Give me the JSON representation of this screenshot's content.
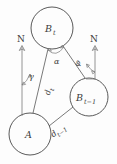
{
  "figure": {
    "type": "geometry-diagram",
    "background_color": "#fdfdfd",
    "stroke_color": "#5a5a5a",
    "text_color": "#3a3a3a"
  },
  "nodes": [
    {
      "id": "b-t",
      "label": "B",
      "subscript": "t",
      "cx": 52,
      "cy": 28,
      "r": 21
    },
    {
      "id": "b-t-minus-1",
      "label": "B",
      "subscript": "t−1",
      "cx": 89,
      "cy": 97,
      "r": 19
    },
    {
      "id": "a",
      "label": "A",
      "subscript": "",
      "cx": 30,
      "cy": 134,
      "r": 21
    }
  ],
  "north_arrows": [
    {
      "id": "north-left",
      "label": "N",
      "label_x": 20,
      "label_y": 41,
      "x": 22,
      "y_top": 46,
      "y_bottom": 116
    },
    {
      "id": "north-right",
      "label": "N",
      "label_x": 93,
      "label_y": 41,
      "x": 95,
      "y_top": 46,
      "y_bottom": 78
    }
  ],
  "angles": [
    {
      "id": "alpha",
      "label": "α",
      "x": 58,
      "y": 62,
      "description": "angle at B_t between line to A and line to B_{t-1}"
    },
    {
      "id": "gamma",
      "label": "γ",
      "x": 32,
      "y": 78,
      "description": "bearing angle at A from North to B_t"
    },
    {
      "id": "phi",
      "label": "φ",
      "x": 80,
      "y": 64,
      "description": "bearing angle at B_{t-1} from North"
    }
  ],
  "distances": [
    {
      "id": "d-t",
      "label": "d",
      "subscript": "t",
      "x": 46,
      "y": 92,
      "rotation": -68,
      "description": "distance from A to B_t"
    },
    {
      "id": "d-t-minus-1",
      "label": "d",
      "subscript": "t−1",
      "x": 57,
      "y": 131,
      "rotation": -22,
      "description": "distance from A to B_{t-1}"
    }
  ],
  "edges": [
    {
      "id": "edge-a-to-bt",
      "from": "a",
      "to": "b-t"
    },
    {
      "id": "edge-a-to-btm1",
      "from": "a",
      "to": "b-t-minus-1"
    },
    {
      "id": "edge-bt-to-btm1",
      "from": "b-t",
      "to": "b-t-minus-1"
    }
  ]
}
